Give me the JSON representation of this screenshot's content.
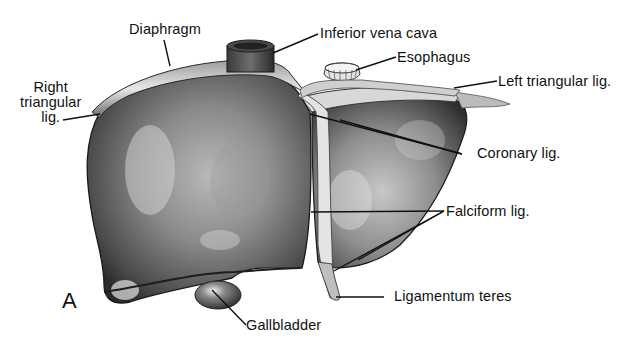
{
  "figure": {
    "panel_letter": "A",
    "labels": {
      "diaphragm": "Diaphragm",
      "inferior_vena_cava": "Inferior vena cava",
      "esophagus": "Esophagus",
      "right_triangular_line1": "Right",
      "right_triangular_line2": "triangular",
      "right_triangular_line3": "lig.",
      "left_triangular": "Left triangular lig.",
      "coronary": "Coronary lig.",
      "falciform": "Falciform lig.",
      "ligamentum_teres": "Ligamentum teres",
      "gallbladder": "Gallbladder"
    }
  }
}
